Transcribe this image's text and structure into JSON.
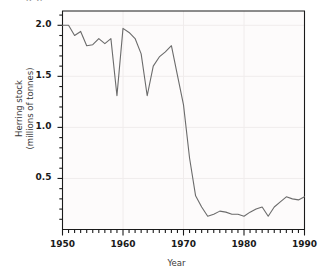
{
  "figure": {
    "title_fragment": "g p",
    "background_color": "#ffffff",
    "plot_background_color": "#fdfbfb",
    "line_color": "#6b6b6b",
    "axis_color": "#1a1a1a",
    "grid_color": "#f0ecec"
  },
  "chart_data": {
    "type": "line",
    "title": "",
    "xlabel": "Year",
    "ylabel": "Herring stock (millions of tonnes)",
    "ylabel_line1": "Herring stock",
    "ylabel_line2": "(millions of tonnes)",
    "xlim": [
      1950,
      1990
    ],
    "ylim": [
      0.0,
      2.14
    ],
    "xticks": [
      1950,
      1960,
      1970,
      1980,
      1990
    ],
    "xtick_labels": [
      "1950",
      "1960",
      "1970",
      "1980",
      "1990"
    ],
    "minor_xtick_interval": 1,
    "yticks": [
      0.5,
      1.0,
      1.5,
      2.0
    ],
    "ytick_labels": [
      "0.5",
      "1.0",
      "1.5",
      "2.0"
    ],
    "minor_ytick_interval": 0.1,
    "grid": true,
    "legend": false,
    "series": [
      {
        "name": "Herring stock",
        "x": [
          1950,
          1951,
          1952,
          1953,
          1954,
          1955,
          1956,
          1957,
          1958,
          1959,
          1960,
          1961,
          1962,
          1963,
          1964,
          1965,
          1966,
          1967,
          1968,
          1969,
          1970,
          1971,
          1972,
          1973,
          1974,
          1975,
          1976,
          1977,
          1978,
          1979,
          1980,
          1981,
          1982,
          1983,
          1984,
          1985,
          1986,
          1987,
          1988,
          1989,
          1990
        ],
        "y": [
          2.0,
          2.0,
          1.9,
          1.94,
          1.8,
          1.81,
          1.87,
          1.82,
          1.87,
          1.31,
          1.97,
          1.93,
          1.87,
          1.72,
          1.31,
          1.6,
          1.69,
          1.74,
          1.8,
          1.51,
          1.22,
          0.7,
          0.33,
          0.22,
          0.13,
          0.15,
          0.18,
          0.17,
          0.15,
          0.15,
          0.13,
          0.17,
          0.2,
          0.22,
          0.13,
          0.22,
          0.27,
          0.32,
          0.3,
          0.29,
          0.32
        ]
      }
    ]
  },
  "ticks": {
    "y": [
      "2.0",
      "1.5",
      "1.0",
      "0.5"
    ],
    "x": [
      "1950",
      "1960",
      "1970",
      "1980",
      "1990"
    ]
  }
}
